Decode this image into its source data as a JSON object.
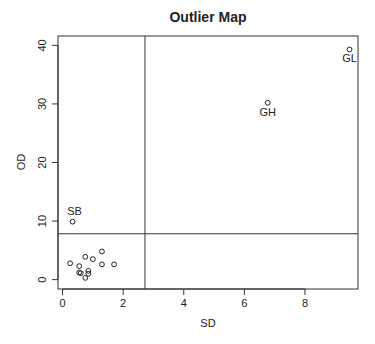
{
  "chart_data": {
    "type": "scatter",
    "title": "Outlier Map",
    "xlabel": "SD",
    "ylabel": "OD",
    "xlim": [
      -0.15,
      9.75
    ],
    "ylim": [
      -1.6,
      41.6
    ],
    "xticks": [
      0,
      2,
      4,
      6,
      8
    ],
    "yticks": [
      0,
      10,
      20,
      30,
      40
    ],
    "grid": false,
    "legend": null,
    "cutoffs": {
      "sd": 2.72,
      "od": 7.83
    },
    "points": [
      {
        "x": 0.25,
        "y": 2.8,
        "label": ""
      },
      {
        "x": 0.55,
        "y": 2.3,
        "label": ""
      },
      {
        "x": 0.75,
        "y": 3.9,
        "label": ""
      },
      {
        "x": 1.0,
        "y": 3.5,
        "label": ""
      },
      {
        "x": 1.3,
        "y": 4.8,
        "label": ""
      },
      {
        "x": 1.3,
        "y": 2.6,
        "label": ""
      },
      {
        "x": 1.7,
        "y": 2.6,
        "label": ""
      },
      {
        "x": 0.55,
        "y": 1.2,
        "label": ""
      },
      {
        "x": 0.6,
        "y": 1.1,
        "label": ""
      },
      {
        "x": 0.85,
        "y": 1.5,
        "label": ""
      },
      {
        "x": 0.85,
        "y": 1.0,
        "label": ""
      },
      {
        "x": 0.75,
        "y": 0.3,
        "label": ""
      },
      {
        "x": 0.33,
        "y": 9.9,
        "label": "SB"
      },
      {
        "x": 6.77,
        "y": 30.2,
        "label": "GH"
      },
      {
        "x": 9.47,
        "y": 39.3,
        "label": "GL"
      }
    ]
  }
}
